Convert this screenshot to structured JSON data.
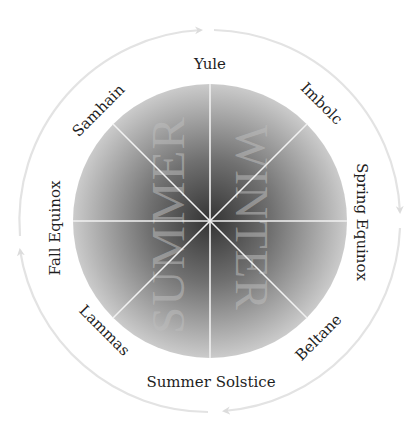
{
  "diagram": {
    "type": "wheel-of-the-year",
    "center": [
      210,
      221
    ],
    "inner_radius": 137,
    "outer_radius": 191,
    "colors": {
      "disc_center": "#3a3a3a",
      "disc_edge": "#c9c9c9",
      "spoke": "#f2f2f2",
      "outer_ring": "#e3e3e3",
      "label_text": "#1e1e1e",
      "season_text": "#bdbdbd"
    },
    "seasons": {
      "left": "SUMMER",
      "right": "WINTER"
    },
    "festivals": [
      {
        "name": "Yule",
        "angle": 0
      },
      {
        "name": "Imbolc",
        "angle": 45
      },
      {
        "name": "Spring Equinox",
        "angle": 90
      },
      {
        "name": "Beltane",
        "angle": 135
      },
      {
        "name": "Summer Solstice",
        "angle": 180
      },
      {
        "name": "Lammas",
        "angle": 225
      },
      {
        "name": "Fall Equinox",
        "angle": 270
      },
      {
        "name": "Samhain",
        "angle": 315
      }
    ],
    "outer_arrows": {
      "direction": "clockwise",
      "count": 4
    }
  }
}
